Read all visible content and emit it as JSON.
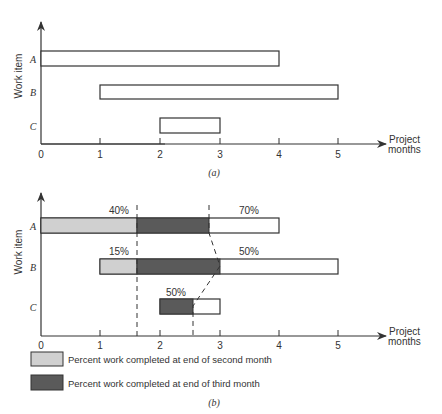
{
  "chart_data": [
    {
      "id": "a",
      "type": "gantt",
      "caption": "(a)",
      "ylabel": "Work item",
      "xlabel": "Project months",
      "xlabel_lines": [
        "Project",
        "months"
      ],
      "xticks": [
        0,
        1,
        2,
        3,
        4,
        5
      ],
      "xlim": [
        0,
        5.7
      ],
      "categories": [
        "A",
        "B",
        "C"
      ],
      "bars": [
        {
          "item": "A",
          "start": 0,
          "end": 4
        },
        {
          "item": "B",
          "start": 1,
          "end": 5
        },
        {
          "item": "C",
          "start": 2,
          "end": 3
        }
      ],
      "grid": false
    },
    {
      "id": "b",
      "type": "gantt",
      "caption": "(b)",
      "ylabel": "Work item",
      "xlabel": "Project months",
      "xlabel_lines": [
        "Project",
        "months"
      ],
      "xticks": [
        0,
        1,
        2,
        3,
        4,
        5
      ],
      "xlim": [
        0,
        5.7
      ],
      "categories": [
        "A",
        "B",
        "C"
      ],
      "bars": [
        {
          "item": "A",
          "start": 0,
          "end": 4,
          "completed_month2_end": 1.6,
          "completed_month3_end": 2.85,
          "pct_month2": "40%",
          "pct_month3": "70%"
        },
        {
          "item": "B",
          "start": 1,
          "end": 5,
          "completed_month2_end": 1.6,
          "completed_month3_end": 3.0,
          "pct_month2": "15%",
          "pct_month3": "50%"
        },
        {
          "item": "C",
          "start": 2,
          "end": 3,
          "completed_month2_end": null,
          "completed_month3_end": 2.55,
          "pct_month2": null,
          "pct_month3": "50%"
        }
      ],
      "status_lines": {
        "end_of_second_month_x": 1.6,
        "end_of_third_month_points": [
          2.85,
          3.0,
          2.55
        ]
      },
      "legend": [
        {
          "label": "Percent work completed at end of second month",
          "color": "#d0d0d0"
        },
        {
          "label": "Percent work completed at end of third month",
          "color": "#5a5a5a"
        }
      ],
      "legend_position": "bottom-left",
      "grid": false
    }
  ],
  "colors": {
    "axis": "#333333",
    "light_fill": "#d0d0d0",
    "dark_fill": "#5a5a5a",
    "bar_outline": "#333333"
  }
}
